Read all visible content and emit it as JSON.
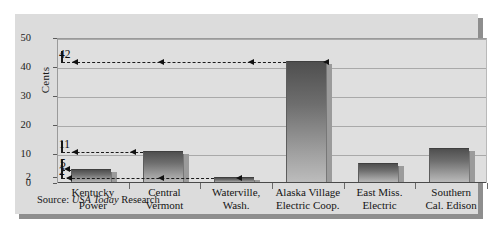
{
  "figure": {
    "source_prefix": "Source:",
    "source_italic": "USA Today",
    "source_suffix": "Research"
  },
  "colors": {
    "panel": "#dcdcdc",
    "plot_background": "#dfdfdf",
    "gridline": "#a9a9a9",
    "bar_top": "#4f4f4f",
    "bar_bottom": "#bdbdbd",
    "annotation": "#1a1a1a",
    "shadow": "#8e8e8e"
  },
  "chart_data": {
    "type": "bar",
    "title": "",
    "xlabel": "",
    "ylabel": "Cents",
    "ylim": [
      0,
      50
    ],
    "grid": true,
    "legend": "none",
    "yticks": [
      0,
      2,
      10,
      20,
      30,
      40,
      50
    ],
    "ytick_labels": [
      "0",
      "2",
      "10",
      "20",
      "30",
      "40",
      "50"
    ],
    "categories": [
      "Kentucky Power",
      "Central Vermont",
      "Waterville, Wash.",
      "Alaska Village Electric Coop.",
      "East Miss. Electric",
      "Southern Cal. Edison"
    ],
    "category_lines": [
      [
        "Kentucky",
        "Power"
      ],
      [
        "Central",
        "Vermont"
      ],
      [
        "Waterville,",
        "Wash."
      ],
      [
        "Alaska Village",
        "Electric Coop."
      ],
      [
        "East Miss.",
        "Electric"
      ],
      [
        "Southern",
        "Cal. Edison"
      ]
    ],
    "values": [
      5,
      11,
      2,
      42,
      7,
      12
    ],
    "annotations": [
      {
        "label": "42",
        "value": 42,
        "note": "dashed reference line at 42 across chart to Alaska Village Electric Coop."
      },
      {
        "label": "11",
        "value": 11,
        "note": "dashed reference line at 11 to Central Vermont"
      },
      {
        "label": "5",
        "value": 5,
        "note": "arrow pointing to Kentucky Power bar top at 5"
      },
      {
        "label": "2",
        "value": 2,
        "note": "dashed reference line at 2 to Waterville, Wash."
      }
    ]
  }
}
